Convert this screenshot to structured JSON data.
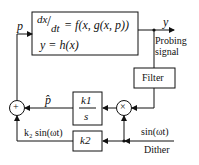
{
  "diagram": {
    "plant": {
      "eq1_lhs_num": "dx",
      "eq1_lhs_den": "dt",
      "eq1_rhs": "= f(x, g(x, p))",
      "eq2": "y = h(x)"
    },
    "signals": {
      "input": "p",
      "output": "y",
      "probing_1": "Probing",
      "probing_2": "signal",
      "p_hat": "p̂",
      "k2_sin": "k₂ sin(ωt)",
      "sin": "sin(ωt)",
      "dither": "Dither"
    },
    "blocks": {
      "filter": "Filter",
      "integrator_num": "k1",
      "integrator_den": "s",
      "gain": "k2",
      "sum": "+",
      "mult": "×"
    }
  },
  "colors": {
    "line": "#111111",
    "background": "#ffffff"
  }
}
